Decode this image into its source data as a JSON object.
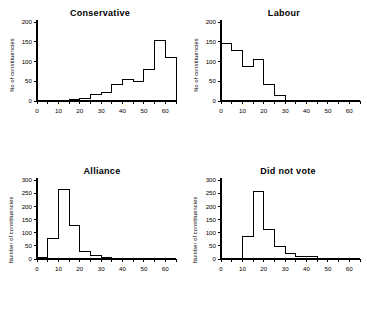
{
  "figure": {
    "background": "#ffffff",
    "ink": "#000000",
    "panel_count": 4
  },
  "chart_data": [
    {
      "type": "bar",
      "panel": "top-left",
      "title": "Conservative",
      "xlabel": "",
      "ylabel": "No of constituencies",
      "bin_width": 5,
      "xlim": [
        0,
        65
      ],
      "ylim": [
        0,
        200
      ],
      "xticks": [
        0,
        10,
        20,
        30,
        40,
        50,
        60
      ],
      "yticks": [
        0,
        50,
        100,
        150,
        200
      ],
      "xtick_labels": [
        "0",
        "10",
        "20",
        "30",
        "40",
        "50",
        "60"
      ],
      "ytick_labels": [
        "0",
        "50",
        "100",
        "150",
        "200"
      ],
      "grid": false,
      "legend": "none",
      "bin_starts": [
        0,
        5,
        10,
        15,
        20,
        25,
        30,
        35,
        40,
        45,
        50,
        55,
        60
      ],
      "categories": [
        "0-5",
        "5-10",
        "10-15",
        "15-20",
        "20-25",
        "25-30",
        "30-35",
        "35-40",
        "40-45",
        "45-50",
        "50-55",
        "55-60",
        "60-65"
      ],
      "values": [
        0,
        0,
        2,
        3,
        6,
        16,
        21,
        42,
        55,
        49,
        81,
        153,
        110,
        12
      ]
    },
    {
      "type": "bar",
      "panel": "top-right",
      "title": "Labour",
      "xlabel": "",
      "ylabel": "No of constituencies",
      "bin_width": 5,
      "xlim": [
        0,
        65
      ],
      "ylim": [
        0,
        200
      ],
      "xticks": [
        0,
        10,
        20,
        30,
        40,
        50,
        60
      ],
      "yticks": [
        0,
        50,
        100,
        150,
        200
      ],
      "xtick_labels": [
        "0",
        "10",
        "20",
        "30",
        "40",
        "50",
        "60"
      ],
      "ytick_labels": [
        "0",
        "50",
        "100",
        "150",
        "200"
      ],
      "grid": false,
      "legend": "none",
      "bin_starts": [
        0,
        5,
        10,
        15,
        20,
        25,
        30,
        35,
        40,
        45,
        50,
        55,
        60
      ],
      "categories": [
        "0-5",
        "5-10",
        "10-15",
        "15-20",
        "20-25",
        "25-30",
        "30-35",
        "35-40",
        "40-45",
        "45-50",
        "50-55",
        "55-60",
        "60-65"
      ],
      "values": [
        146,
        129,
        88,
        106,
        42,
        14,
        2,
        1,
        0,
        0,
        0,
        0,
        0
      ]
    },
    {
      "type": "bar",
      "panel": "bottom-left",
      "title": "Alliance",
      "xlabel": "",
      "ylabel": "Number of constituencies",
      "bin_width": 5,
      "xlim": [
        0,
        65
      ],
      "ylim": [
        0,
        300
      ],
      "xticks": [
        0,
        10,
        20,
        30,
        40,
        50,
        60
      ],
      "yticks": [
        0,
        50,
        100,
        150,
        200,
        250,
        300
      ],
      "xtick_labels": [
        "0",
        "10",
        "20",
        "30",
        "40",
        "50",
        "60"
      ],
      "ytick_labels": [
        "0",
        "50",
        "100",
        "150",
        "200",
        "250",
        "300"
      ],
      "grid": false,
      "legend": "none",
      "bin_starts": [
        0,
        5,
        10,
        15,
        20,
        25,
        30,
        35,
        40,
        45,
        50,
        55,
        60
      ],
      "categories": [
        "0-5",
        "5-10",
        "10-15",
        "15-20",
        "20-25",
        "25-30",
        "30-35",
        "35-40",
        "40-45",
        "45-50",
        "50-55",
        "55-60",
        "60-65"
      ],
      "values": [
        7,
        79,
        265,
        126,
        30,
        13,
        4,
        2,
        0,
        0,
        0,
        0,
        0
      ]
    },
    {
      "type": "bar",
      "panel": "bottom-right",
      "title": "Did not vote",
      "xlabel": "",
      "ylabel": "Number of constituencies",
      "bin_width": 5,
      "xlim": [
        0,
        65
      ],
      "ylim": [
        0,
        300
      ],
      "xticks": [
        0,
        10,
        20,
        30,
        40,
        50,
        60
      ],
      "yticks": [
        0,
        50,
        100,
        150,
        200,
        250,
        300
      ],
      "xtick_labels": [
        "0",
        "10",
        "20",
        "30",
        "40",
        "50",
        "60"
      ],
      "ytick_labels": [
        "0",
        "50",
        "100",
        "150",
        "200",
        "250",
        "300"
      ],
      "grid": false,
      "legend": "none",
      "bin_starts": [
        0,
        5,
        10,
        15,
        20,
        25,
        30,
        35,
        40,
        45,
        50,
        55,
        60
      ],
      "categories": [
        "0-5",
        "5-10",
        "10-15",
        "15-20",
        "20-25",
        "25-30",
        "30-35",
        "35-40",
        "40-45",
        "45-50",
        "50-55",
        "55-60",
        "60-65"
      ],
      "values": [
        0,
        1,
        85,
        258,
        112,
        46,
        21,
        8,
        9,
        1,
        0,
        0,
        0
      ]
    }
  ]
}
